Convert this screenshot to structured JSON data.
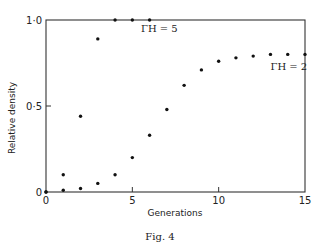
{
  "chart_data": {
    "type": "scatter",
    "title": "",
    "caption": "Fig. 4",
    "xlabel": "Generations",
    "ylabel": "Relative density",
    "xlim": [
      0,
      15
    ],
    "ylim": [
      0,
      1.0
    ],
    "xticks": [
      0,
      5,
      10,
      15
    ],
    "xtick_labels": [
      "0",
      "5",
      "10",
      "15"
    ],
    "yticks": [
      0,
      0.5,
      1.0
    ],
    "ytick_labels": [
      "0",
      "0·5",
      "1·0"
    ],
    "grid": false,
    "series": [
      {
        "name": "ΓH = 5",
        "x": [
          0,
          1,
          2,
          3,
          4,
          5,
          6
        ],
        "y": [
          0.0,
          0.1,
          0.44,
          0.89,
          1.0,
          1.0,
          1.0
        ]
      },
      {
        "name": "ΓH = 2",
        "x": [
          0,
          1,
          2,
          3,
          4,
          5,
          6,
          7,
          8,
          9,
          10,
          11,
          12,
          13,
          14,
          15
        ],
        "y": [
          0.0,
          0.01,
          0.02,
          0.05,
          0.1,
          0.2,
          0.33,
          0.48,
          0.62,
          0.71,
          0.76,
          0.78,
          0.79,
          0.8,
          0.8,
          0.8
        ]
      }
    ],
    "annotations": [
      {
        "text": "ΓH = 5",
        "near_series": "ΓH = 5",
        "at_x": 5.5,
        "at_y": 0.93
      },
      {
        "text": "ΓH = 2",
        "near_series": "ΓH = 2",
        "at_x": 13.0,
        "at_y": 0.71
      }
    ]
  }
}
